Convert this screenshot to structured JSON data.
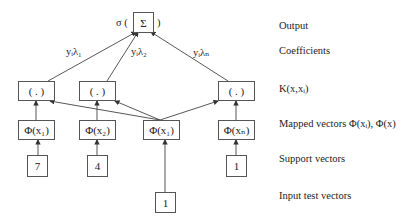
{
  "diagram": {
    "output_node": {
      "symbol": "Σ",
      "prefix": "σ (",
      "suffix": ")"
    },
    "coefficients": [
      "yᵢλ₁",
      "yᵢλ₂",
      "yᵢλₙ"
    ],
    "kernel_nodes": [
      "( . )",
      "( . )",
      "( . )"
    ],
    "mapped_nodes": [
      "Φ(x₁)",
      "Φ(x₂)",
      "Φ(x₁)",
      "Φ(xₙ)"
    ],
    "support_vectors": [
      "7",
      "4",
      "1"
    ],
    "input_vector": "1"
  },
  "row_labels": {
    "output": "Output",
    "coefficients": "Coefficients",
    "kernel": "K(x,xᵢ)",
    "mapped": "Mapped vectors Φ(xᵢ), Φ(x)",
    "support": "Support vectors",
    "input": "Input test vectors"
  }
}
